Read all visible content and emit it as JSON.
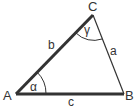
{
  "diagram": {
    "type": "triangle",
    "vertices": [
      {
        "id": "A",
        "label": "A"
      },
      {
        "id": "B",
        "label": "B"
      },
      {
        "id": "C",
        "label": "C"
      }
    ],
    "sides": [
      {
        "id": "a",
        "label": "a",
        "from": "C",
        "to": "B",
        "emphasis": "thin"
      },
      {
        "id": "b",
        "label": "b",
        "from": "A",
        "to": "C",
        "emphasis": "thick"
      },
      {
        "id": "c",
        "label": "c",
        "from": "A",
        "to": "B",
        "emphasis": "thick"
      }
    ],
    "angles": [
      {
        "id": "alpha",
        "label": "α",
        "vertex": "A"
      },
      {
        "id": "gamma",
        "label": "γ",
        "vertex": "C"
      }
    ],
    "colors": {
      "stroke": "#333333",
      "background": "#ffffff"
    }
  }
}
